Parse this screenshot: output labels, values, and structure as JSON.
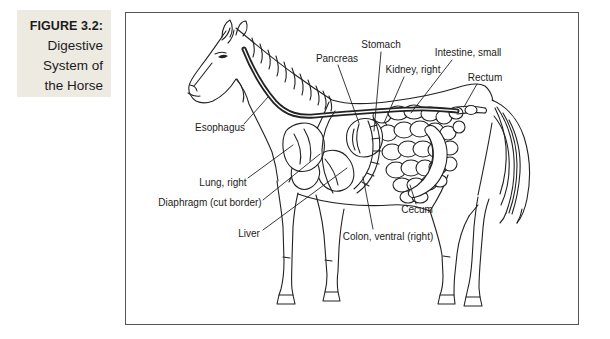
{
  "figure": {
    "label": "FIGURE 3.2:",
    "title": "Digestive System of the Horse"
  },
  "diagram": {
    "labels": [
      {
        "id": "pancreas",
        "text": "Pancreas"
      },
      {
        "id": "stomach",
        "text": "Stomach"
      },
      {
        "id": "kidney-right",
        "text": "Kidney, right"
      },
      {
        "id": "intestine-small",
        "text": "Intestine, small"
      },
      {
        "id": "rectum",
        "text": "Rectum"
      },
      {
        "id": "esophagus",
        "text": "Esophagus"
      },
      {
        "id": "lung-right",
        "text": "Lung, right"
      },
      {
        "id": "diaphragm",
        "text": "Diaphragm (cut border)"
      },
      {
        "id": "liver",
        "text": "Liver"
      },
      {
        "id": "cecum",
        "text": "Cecum"
      },
      {
        "id": "colon-ventral-right",
        "text": "Colon, ventral (right)"
      }
    ],
    "colors": {
      "ink": "#222222",
      "caption_bg": "#edeae2",
      "frame_border": "#555555",
      "background": "#ffffff"
    }
  }
}
